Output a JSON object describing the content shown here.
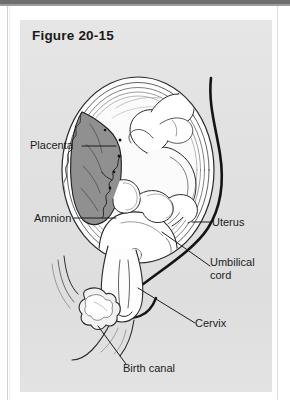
{
  "figure": {
    "title": "Figure 20-15",
    "panel_color": "#e2e2e2",
    "ink_color": "#1c1c1c",
    "placenta_fill": "#8f8f8f"
  },
  "labels": {
    "placenta": "Placenta",
    "amnion": "Amnion",
    "uterus": "Uterus",
    "umbilical_cord_line1": "Umbilical",
    "umbilical_cord_line2": "cord",
    "cervix": "Cervix",
    "birth_canal": "Birth canal"
  },
  "diagram": {
    "type": "anatomical-illustration",
    "structures": [
      "uterus",
      "placenta",
      "amnion",
      "umbilical cord",
      "fetus",
      "cervix",
      "birth canal",
      "pubic symphysis",
      "abdominal wall"
    ]
  }
}
